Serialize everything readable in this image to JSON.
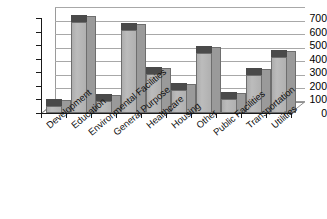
{
  "chart_data": {
    "type": "bar",
    "title": "",
    "subtitle": "",
    "xlabel": "",
    "ylabel": "",
    "categories": [
      "Development",
      "Education",
      "Environmental Facilities",
      "General Purpose",
      "Healthcare",
      "Housing",
      "Other",
      "Public Facilities",
      "Transportation",
      "Utilities"
    ],
    "values": [
      55,
      670,
      85,
      615,
      285,
      170,
      440,
      105,
      280,
      410
    ],
    "ylim": [
      0,
      700
    ],
    "ytick_labels": [
      "700",
      "600",
      "500",
      "400",
      "300",
      "200",
      "100",
      "0"
    ],
    "ytick_values": [
      700,
      600,
      500,
      400,
      300,
      200,
      100,
      0
    ],
    "ytick_step": 100,
    "grid": true,
    "legend": false,
    "legend_position": "none",
    "style": "3d-column",
    "series": [
      {
        "name": "",
        "values": [
          55,
          670,
          85,
          615,
          285,
          170,
          440,
          105,
          280,
          410
        ]
      }
    ],
    "colors": {
      "bar_front": "#b4b4b4",
      "bar_side": "#9a9a9a",
      "bar_top": "#4a4a4a",
      "bar_outline": "#6e6e6e",
      "gridline": "#a8a8a8",
      "axis": "#1a1a1a",
      "background": "#ffffff",
      "text": "#111111"
    }
  }
}
